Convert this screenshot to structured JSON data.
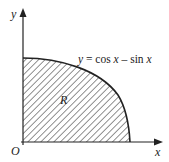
{
  "figure": {
    "axis_labels": {
      "x": "x",
      "y": "y",
      "origin": "O"
    },
    "curve_equation": {
      "lhs": "y",
      "eq": " = cos ",
      "x1": "x",
      "minus": " – sin ",
      "x2": "x"
    },
    "region_label": "R",
    "colors": {
      "ink": "#222222",
      "hatch": "#555555",
      "background": "#ffffff"
    }
  }
}
